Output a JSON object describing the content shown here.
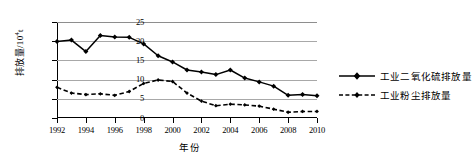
{
  "chart_data": {
    "type": "line",
    "title": "",
    "xlabel": "年份",
    "ylabel": "排放量/10⁴t",
    "ylabel_base": "排放量/10",
    "ylabel_exp": "4",
    "ylabel_unit": "t",
    "grid": true,
    "legend_position": "right",
    "xlim": [
      1992,
      2010
    ],
    "ylim": [
      0,
      25
    ],
    "ytick_labels": [
      "25",
      "20",
      "15",
      "10",
      "5",
      "0"
    ],
    "ytick_values": [
      25,
      20,
      15,
      10,
      5,
      0
    ],
    "xtick_labels": [
      "1992",
      "1994",
      "1996",
      "1998",
      "2000",
      "2002",
      "2004",
      "2006",
      "2008",
      "2010"
    ],
    "xtick_values": [
      1992,
      1994,
      1996,
      1998,
      2000,
      2002,
      2004,
      2006,
      2008,
      2010
    ],
    "x": [
      1992,
      1993,
      1994,
      1995,
      1996,
      1997,
      1998,
      1999,
      2000,
      2001,
      2002,
      2003,
      2004,
      2005,
      2006,
      2007,
      2008,
      2009,
      2010
    ],
    "series": [
      {
        "name": "工业二氧化硫排放量",
        "style": "solid",
        "marker": "diamond",
        "color": "#000000",
        "values": [
          19.9,
          20.3,
          17.3,
          21.5,
          21.1,
          21.0,
          19.3,
          16.2,
          14.6,
          12.5,
          12.0,
          11.3,
          12.5,
          10.4,
          9.4,
          8.3,
          5.9,
          6.1,
          5.8
        ]
      },
      {
        "name": "工业粉尘排放量",
        "style": "dashed",
        "marker": "diamond-small",
        "color": "#000000",
        "values": [
          8.0,
          6.5,
          6.1,
          6.3,
          5.9,
          6.9,
          9.0,
          9.9,
          9.5,
          6.5,
          4.4,
          3.2,
          3.6,
          3.4,
          3.1,
          2.3,
          1.5,
          1.7,
          1.7
        ]
      }
    ]
  },
  "legend": {
    "items": [
      {
        "label": "工业二氧化硫排放量",
        "style": "solid"
      },
      {
        "label": "工业粉尘排放量",
        "style": "dashed"
      }
    ]
  }
}
